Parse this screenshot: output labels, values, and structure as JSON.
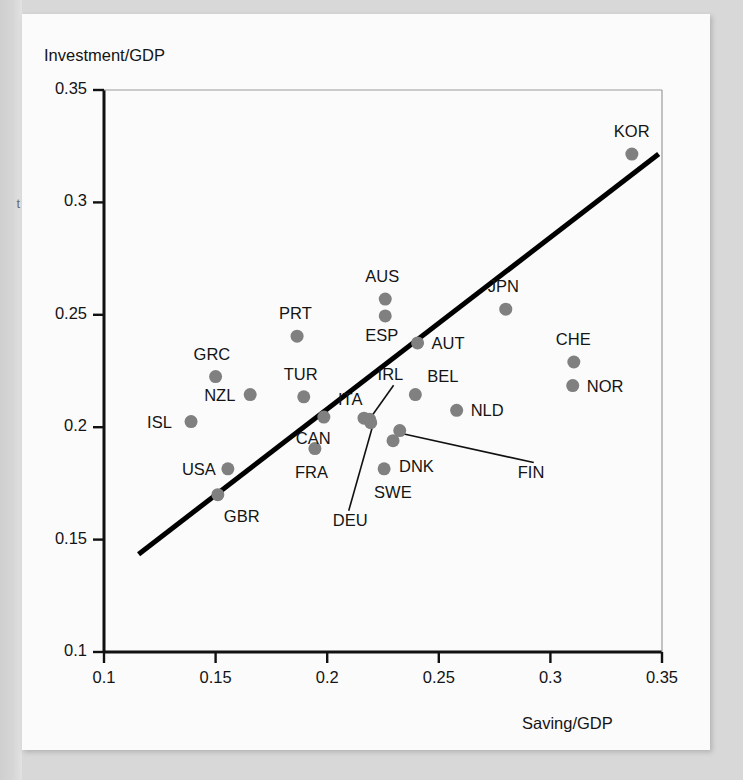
{
  "figure": {
    "margin_note": "t",
    "y_axis_title": "Investment/GDP",
    "x_axis_title": "Saving/GDP"
  },
  "chart_data": {
    "type": "scatter",
    "title": "",
    "xlabel": "Saving/GDP",
    "ylabel": "Investment/GDP",
    "xlim": [
      0.1,
      0.35
    ],
    "ylim": [
      0.1,
      0.35
    ],
    "xticks": [
      0.1,
      0.15,
      0.2,
      0.25,
      0.3,
      0.35
    ],
    "yticks": [
      0.1,
      0.15,
      0.2,
      0.25,
      0.3,
      0.35
    ],
    "xtick_labels": [
      "0.1",
      "0.15",
      "0.2",
      "0.25",
      "0.3",
      "0.35"
    ],
    "ytick_labels": [
      "0.1",
      "0.15",
      "0.2",
      "0.25",
      "0.3",
      "0.35"
    ],
    "grid": false,
    "legend": false,
    "point_color": "#808080",
    "line_color": "#000000",
    "trend_line": {
      "x": [
        0.1155,
        0.3485
      ],
      "y": [
        0.1435,
        0.3215
      ]
    },
    "points": [
      {
        "label": "ISL",
        "x": 0.139,
        "y": 0.2025,
        "label_dx": -44,
        "label_dy": -9,
        "leader": false
      },
      {
        "label": "GRC",
        "x": 0.15,
        "y": 0.2225,
        "label_dx": -22,
        "label_dy": -32,
        "leader": false
      },
      {
        "label": "USA",
        "x": 0.1555,
        "y": 0.1815,
        "label_dx": -46,
        "label_dy": -9,
        "leader": false
      },
      {
        "label": "GBR",
        "x": 0.151,
        "y": 0.17,
        "label_dx": 6,
        "label_dy": 12,
        "leader": false
      },
      {
        "label": "NZL",
        "x": 0.1655,
        "y": 0.2145,
        "label_dx": -46,
        "label_dy": -9,
        "leader": false
      },
      {
        "label": "PRT",
        "x": 0.1865,
        "y": 0.2405,
        "label_dx": -18,
        "label_dy": -32,
        "leader": false
      },
      {
        "label": "TUR",
        "x": 0.1895,
        "y": 0.2135,
        "label_dx": -20,
        "label_dy": -32,
        "leader": false
      },
      {
        "label": "CAN",
        "x": 0.1985,
        "y": 0.2045,
        "label_dx": -28,
        "label_dy": 12,
        "leader": false
      },
      {
        "label": "FRA",
        "x": 0.1945,
        "y": 0.1905,
        "label_dx": -20,
        "label_dy": 14,
        "leader": false
      },
      {
        "label": "ITA",
        "x": 0.2165,
        "y": 0.204,
        "label_dx": -26,
        "label_dy": -28,
        "leader": false
      },
      {
        "label": "AUS",
        "x": 0.226,
        "y": 0.257,
        "label_dx": -20,
        "label_dy": -32,
        "leader": false
      },
      {
        "label": "ESP",
        "x": 0.226,
        "y": 0.2495,
        "label_dx": -20,
        "label_dy": 10,
        "leader": false
      },
      {
        "label": "IRL",
        "x": 0.219,
        "y": 0.2035,
        "label_dx": 8,
        "label_dy": -54,
        "leader": true
      },
      {
        "label": "DEU",
        "x": 0.2195,
        "y": 0.202,
        "label_dx": -38,
        "label_dy": 88,
        "leader": true
      },
      {
        "label": "AUT",
        "x": 0.2405,
        "y": 0.2375,
        "label_dx": 14,
        "label_dy": -9,
        "leader": false
      },
      {
        "label": "BEL",
        "x": 0.2395,
        "y": 0.2145,
        "label_dx": 12,
        "label_dy": -28,
        "leader": false
      },
      {
        "label": "NLD",
        "x": 0.258,
        "y": 0.2075,
        "label_dx": 14,
        "label_dy": -9,
        "leader": false
      },
      {
        "label": "FIN",
        "x": 0.2325,
        "y": 0.1985,
        "label_dx": 118,
        "label_dy": 32,
        "leader": true
      },
      {
        "label": "DNK",
        "x": 0.2295,
        "y": 0.194,
        "label_dx": 6,
        "label_dy": 16,
        "leader": false
      },
      {
        "label": "SWE",
        "x": 0.2255,
        "y": 0.1815,
        "label_dx": -10,
        "label_dy": 14,
        "leader": false
      },
      {
        "label": "JPN",
        "x": 0.28,
        "y": 0.2525,
        "label_dx": -18,
        "label_dy": -32,
        "leader": false
      },
      {
        "label": "CHE",
        "x": 0.3105,
        "y": 0.229,
        "label_dx": -18,
        "label_dy": -32,
        "leader": false
      },
      {
        "label": "NOR",
        "x": 0.31,
        "y": 0.2185,
        "label_dx": 14,
        "label_dy": -9,
        "leader": false
      },
      {
        "label": "KOR",
        "x": 0.3365,
        "y": 0.3215,
        "label_dx": -18,
        "label_dy": -32,
        "leader": false
      }
    ]
  }
}
